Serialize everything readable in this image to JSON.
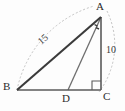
{
  "figure": {
    "kind": "geometry-diagram",
    "background_color": "#fdfdfd"
  },
  "vertices": [
    {
      "name": "A",
      "label": "A",
      "x": 101,
      "y": 17,
      "label_x": 96,
      "label_y": 1
    },
    {
      "name": "B",
      "label": "B",
      "x": 17,
      "y": 90,
      "label_x": 3,
      "label_y": 81
    },
    {
      "name": "C",
      "label": "C",
      "x": 101,
      "y": 90,
      "label_x": 103,
      "label_y": 91
    },
    {
      "name": "D",
      "label": "D",
      "x": 68,
      "y": 90,
      "label_x": 62,
      "label_y": 93
    }
  ],
  "segments": [
    {
      "name": "segment-BA",
      "from": "B",
      "to": "A",
      "x1": 17,
      "y1": 90,
      "x2": 101,
      "y2": 17,
      "color": "#3b3b3b",
      "width": 2.1
    },
    {
      "name": "segment-BC",
      "from": "B",
      "to": "C",
      "x1": 17,
      "y1": 90,
      "x2": 101,
      "y2": 90,
      "color": "#5a5a5a",
      "width": 1.6
    },
    {
      "name": "segment-AC",
      "from": "A",
      "to": "C",
      "x1": 101,
      "y1": 17,
      "x2": 101,
      "y2": 90,
      "color": "#5a5a5a",
      "width": 1.6
    },
    {
      "name": "segment-AD",
      "from": "A",
      "to": "D",
      "x1": 101,
      "y1": 17,
      "x2": 68,
      "y2": 90,
      "color": "#6e6e6e",
      "width": 1.3
    }
  ],
  "arcs": [
    {
      "name": "arc-radius-15",
      "center": "A",
      "path": "M 17 90 A 111 111 0 0 1 94 6",
      "color": "#c2c2c2",
      "dash": "2,2"
    },
    {
      "name": "arc-radius-10",
      "center": "A",
      "path": "M 107 11 A 78 78 0 0 1 99 92",
      "color": "#c2c2c2",
      "dash": "2,2"
    }
  ],
  "measure_labels": [
    {
      "name": "length-label-15",
      "text": "15",
      "x": 36,
      "y": 39
    },
    {
      "name": "length-label-10",
      "text": "10",
      "x": 106,
      "y": 45
    }
  ],
  "markers": {
    "right_angle": {
      "name": "right-angle-marker-C",
      "at_vertex": "C",
      "points": "92,90 92,81 101,81",
      "color": "#5a5a5a"
    },
    "angle_ticks": {
      "name": "angle-bisector-ticks-A",
      "at_vertex": "A",
      "count": 2,
      "color": "#3b3b3b",
      "ticks": [
        {
          "x1": 94.5,
          "y1": 24.5,
          "x2": 97.5,
          "y2": 26.2
        },
        {
          "x1": 96.0,
          "y1": 27.6,
          "x2": 99.0,
          "y2": 29.0
        }
      ]
    }
  },
  "colors": {
    "stroke_dark": "#3b3b3b",
    "stroke_mid": "#5a5a5a",
    "stroke_light": "#6e6e6e",
    "arc_gray": "#c2c2c2",
    "text": "#2b2b2b"
  }
}
